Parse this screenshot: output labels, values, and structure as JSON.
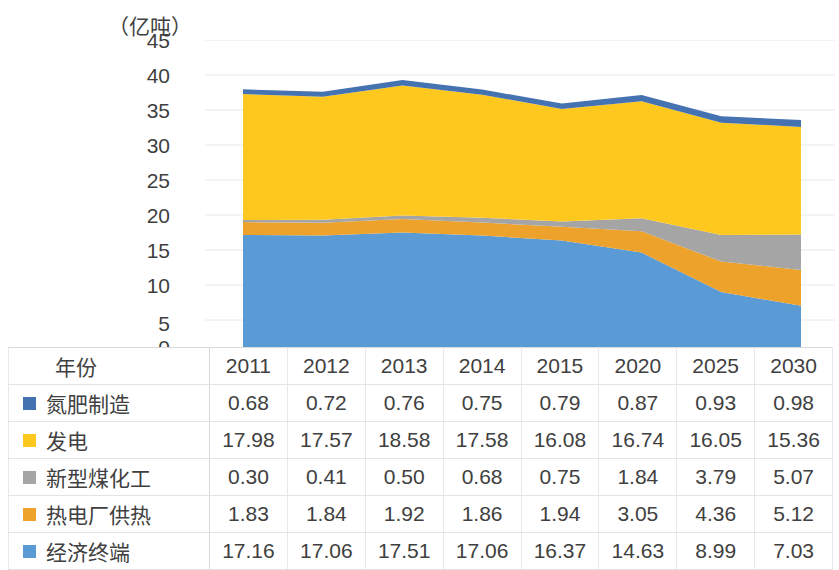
{
  "chart_data": {
    "type": "area",
    "stacked": true,
    "title": "",
    "xlabel": "",
    "ylabel": "（亿吨）",
    "ylim": [
      0,
      45
    ],
    "yticks": [
      45,
      40,
      35,
      30,
      25,
      20,
      15,
      10,
      5,
      0
    ],
    "grid": true,
    "legend_position": "table-left",
    "categories": [
      "2011",
      "2012",
      "2013",
      "2014",
      "2015",
      "2020",
      "2025",
      "2030"
    ],
    "stack_order_bottom_to_top": [
      "经济终端",
      "热电厂供热",
      "新型煤化工",
      "发电",
      "氮肥制造"
    ],
    "series": [
      {
        "name": "氮肥制造",
        "color": "#4572b0",
        "values": [
          0.68,
          0.72,
          0.76,
          0.75,
          0.79,
          0.87,
          0.93,
          0.98
        ]
      },
      {
        "name": "发电",
        "color": "#ffc81e",
        "values": [
          17.98,
          17.57,
          18.58,
          17.58,
          16.08,
          16.74,
          16.05,
          15.36
        ]
      },
      {
        "name": "新型煤化工",
        "color": "#a5a5a5",
        "values": [
          0.3,
          0.41,
          0.5,
          0.68,
          0.75,
          1.84,
          3.79,
          5.07
        ]
      },
      {
        "name": "热电厂供热",
        "color": "#eda22c",
        "values": [
          1.83,
          1.84,
          1.92,
          1.86,
          1.94,
          3.05,
          4.36,
          5.12
        ]
      },
      {
        "name": "经济终端",
        "color": "#5b9bd5",
        "values": [
          17.16,
          17.06,
          17.51,
          17.06,
          16.37,
          14.63,
          8.99,
          7.03
        ]
      }
    ]
  },
  "table": {
    "year_label": "年份",
    "columns": [
      "2011",
      "2012",
      "2013",
      "2014",
      "2015",
      "2020",
      "2025",
      "2030"
    ],
    "rows": [
      {
        "label": "氮肥制造",
        "color": "#4572b0",
        "values": [
          "0.68",
          "0.72",
          "0.76",
          "0.75",
          "0.79",
          "0.87",
          "0.93",
          "0.98"
        ]
      },
      {
        "label": "发电",
        "color": "#ffc81e",
        "values": [
          "17.98",
          "17.57",
          "18.58",
          "17.58",
          "16.08",
          "16.74",
          "16.05",
          "15.36"
        ]
      },
      {
        "label": "新型煤化工",
        "color": "#a5a5a5",
        "values": [
          "0.30",
          "0.41",
          "0.50",
          "0.68",
          "0.75",
          "1.84",
          "3.79",
          "5.07"
        ]
      },
      {
        "label": "热电厂供热",
        "color": "#eda22c",
        "values": [
          "1.83",
          "1.84",
          "1.92",
          "1.86",
          "1.94",
          "3.05",
          "4.36",
          "5.12"
        ]
      },
      {
        "label": "经济终端",
        "color": "#5b9bd5",
        "values": [
          "17.16",
          "17.06",
          "17.51",
          "17.06",
          "16.37",
          "14.63",
          "8.99",
          "7.03"
        ]
      }
    ]
  },
  "style": {
    "gridline_color": "#e8e8e8",
    "text_color": "#3f3f3f",
    "background": "#ffffff"
  }
}
